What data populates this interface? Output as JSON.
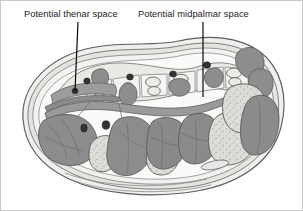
{
  "figure": {
    "type": "anatomical-illustration",
    "view": "transverse section of hand at metacarpal level",
    "style": "grayscale line drawing",
    "background_color": "#ffffff",
    "border_color": "#c9c9c9"
  },
  "labels": [
    {
      "id": "thenar",
      "text": "Potential thenar space",
      "x": 23,
      "y": 8,
      "leader": {
        "from_x": 77,
        "from_y": 21,
        "to_x": 74,
        "to_y": 90
      }
    },
    {
      "id": "midpalmar",
      "text": "Potential midpalmar space",
      "x": 137,
      "y": 8,
      "leader": {
        "from_x": 202,
        "from_y": 21,
        "to_x": 202,
        "to_y": 96
      }
    }
  ],
  "colors": {
    "outline": "#5a5a5a",
    "fascia_light": "#efefed",
    "fascia_mid": "#d2d2cf",
    "muscle_dark": "#8e8e8e",
    "muscle_darker": "#7b7b7b",
    "tendon_stipple": "#dcdcd8",
    "bone_fill": "#e6e6e3",
    "vessel_dark": "#3a3a3a",
    "skin_band": "#e3e3e0",
    "stipple_dot": "#9d9d9a",
    "label_text": "#1b1b1b",
    "leader_line": "#000000"
  },
  "structures": {
    "outer_skin_layers": 4,
    "metacarpal_bones": 5,
    "interosseous_muscles": 4,
    "flexor_tendon_bundles": 4,
    "thenar_muscle_mass": 1,
    "hypothenar_muscle_mass": 1,
    "neurovascular_bundles": 5
  }
}
